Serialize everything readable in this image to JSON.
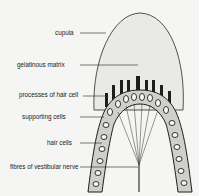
{
  "diagram": {
    "labels": [
      {
        "id": "cupula",
        "text": "cupula"
      },
      {
        "id": "gelatinous_matrix",
        "text": "gelatinous matrix"
      },
      {
        "id": "processes_of_hair_cell",
        "text": "processes of hair cell"
      },
      {
        "id": "supporting_cells",
        "text": "supporting cells"
      },
      {
        "id": "hair_cells",
        "text": "hair cells"
      },
      {
        "id": "fibres_of_vestibular_nerve",
        "text": "fibres of vestibular nerve"
      }
    ],
    "colors": {
      "background": "#f5f5f3",
      "cupula_fill": "#e9e9e6",
      "ink": "#1e1e1e",
      "cell_fill": "#5a5a5a"
    }
  }
}
